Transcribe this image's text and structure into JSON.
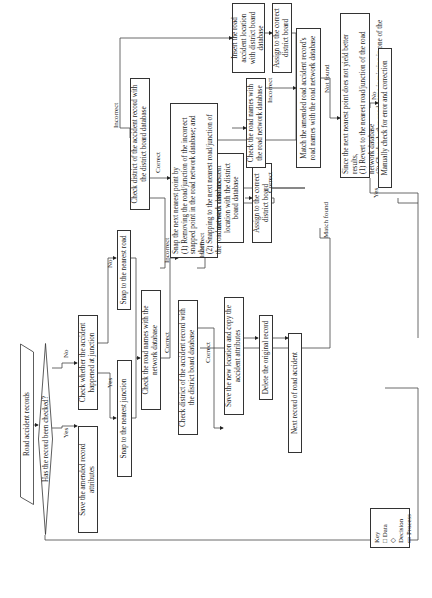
{
  "diagram": {
    "nodes": {
      "start": "Road accident records",
      "checked": "Has the record been checked?",
      "save_amended": "Save the amended record attributes",
      "check_junction": "Check whether the accident happened at junction",
      "snap_junction": "Snap to the nearest junction",
      "snap_road": "Snap to the nearest road",
      "check_names1": "Check the road names with the network database",
      "check_district1": "Check district of the accident record with the district board database",
      "intersect": "Intersect road accident location with the district board database",
      "assign1": "Assign to the correct district board",
      "save_new": "Save the new location and copy the accident attributes",
      "delete_orig": "Delete the original record",
      "next_record": "Next record of road accident",
      "check_district2": "Check district of the accident record with the district board database",
      "insert": "Insert the road accident location with district board database",
      "assign2": "Assign to the correct district board",
      "snap_next_title": "Snap the next nearest point by",
      "snap_next_1": "(1) Removing the road/junction of the incorrect snapped point in the road network database; and then",
      "snap_next_2": "(2) Snapping to the next nearest road/junction of the road network database",
      "check_names2": "Check the road names with the road network database",
      "match_amended": "Match the amended road accident record's road names with the road network database",
      "since_title": "Since the next nearest point does not yield better results,",
      "since_1": "(1) Revert to the nearest road/junction of the road network database",
      "since_2": "(2) Check whether road name is missing in one of the databases",
      "manual": "Manually check for error and correction"
    },
    "edge_labels": {
      "yes": "Yes",
      "no": "No",
      "correct": "Correct",
      "incorrect": "Incorrect",
      "match_found": "Match found",
      "not_found": "Not found"
    },
    "key": {
      "title": "Key",
      "items": [
        {
          "symbol": "□",
          "label": "Data"
        },
        {
          "symbol": "◇",
          "label": "Decision"
        },
        {
          "symbol": "▭",
          "label": "Process"
        }
      ]
    }
  }
}
